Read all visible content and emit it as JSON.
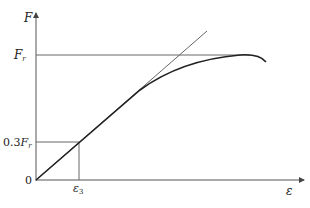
{
  "diagram": {
    "type": "force-strain curve",
    "axes": {
      "y_label": "F",
      "x_label": "ε",
      "origin_label": "0"
    },
    "y_ticks": [
      {
        "label_prefix": "",
        "label_main": "F",
        "label_sub": "r"
      },
      {
        "label_prefix": "0.3",
        "label_main": "F",
        "label_sub": "r"
      }
    ],
    "x_ticks": [
      {
        "label_main": "ε",
        "label_sub": "3"
      }
    ],
    "elements": [
      "linear tangent line",
      "nonlinear curve",
      "Fr horizontal guide",
      "0.3Fr guide lines"
    ],
    "colors": {
      "line": "#555555",
      "curve": "#222222"
    }
  }
}
